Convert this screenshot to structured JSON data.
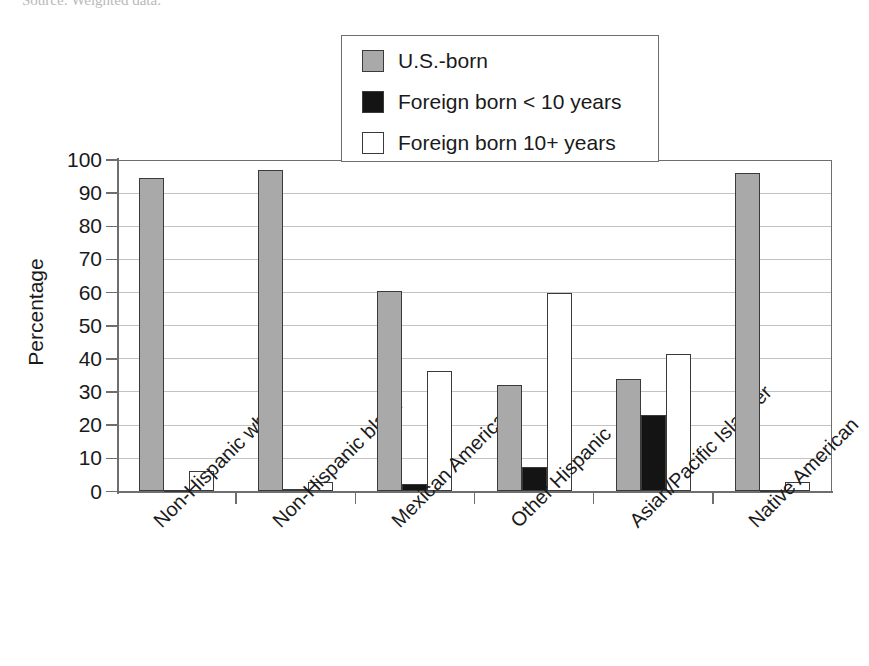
{
  "caption": {
    "clipped_line": "Source: Weighted data."
  },
  "chart_data": {
    "type": "bar",
    "title": "",
    "xlabel": "",
    "ylabel": "Percentage",
    "ylim": [
      0,
      100
    ],
    "ytick_step": 10,
    "ytick_labels": [
      "100",
      "90",
      "80",
      "70",
      "60",
      "50",
      "40",
      "30",
      "20",
      "10",
      "0"
    ],
    "grid": true,
    "grid_axis": "y",
    "legend_position": "top-center",
    "categories": [
      "Non-Hispanic white",
      "Non-Hispanic black",
      "Mexican American",
      "Other Hispanic",
      "Asian/Pacific Islander",
      "Native American"
    ],
    "series": [
      {
        "name": "U.S.-born",
        "key": "usborn",
        "color": "#a9a9a9",
        "values": [
          94.5,
          97,
          60.5,
          32,
          34,
          96
        ]
      },
      {
        "name": "Foreign born < 10 years",
        "key": "lt10",
        "color": "#141414",
        "values": [
          0.5,
          0.7,
          2.2,
          7.5,
          23,
          0.6
        ]
      },
      {
        "name": "Foreign born 10+ years",
        "key": "ge10",
        "color": "#ffffff",
        "values": [
          6.2,
          3.0,
          36.5,
          60,
          41.5,
          3.0
        ]
      }
    ]
  }
}
